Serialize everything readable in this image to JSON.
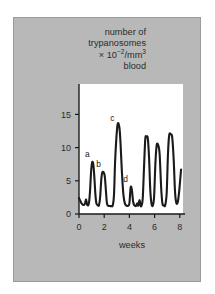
{
  "figure": {
    "background": "#ffffff",
    "panel_color": "#b8b8b8",
    "plot_background": "#ffffff",
    "line_color": "#1a1a1a"
  },
  "axis_title": {
    "line1": "number of",
    "line2": "trypanosomes",
    "line3_prefix": "× 10",
    "line3_exponent": "−2",
    "line3_suffix": "/mm",
    "line3_suffix_exponent": "3",
    "line4": "blood"
  },
  "chart_data": {
    "type": "line",
    "xlabel": "weeks",
    "ylabel": "number of trypanosomes × 10⁻²/mm³ blood",
    "xlim": [
      0,
      8.25
    ],
    "ylim": [
      0,
      17.5
    ],
    "xticks": [
      0,
      2,
      4,
      6,
      8
    ],
    "xticklabels": [
      "0",
      "2",
      "4",
      "6",
      "8"
    ],
    "yticks": [
      0,
      5,
      10,
      15
    ],
    "yticklabels": [
      "0",
      "5",
      "10",
      "15"
    ],
    "grid": false,
    "legend": null,
    "annotations": [
      {
        "label": "a",
        "x": 1.05,
        "y": 7.8,
        "note": "first major parasitaemia peak"
      },
      {
        "label": "b",
        "x": 1.95,
        "y": 6.3,
        "note": "second peak"
      },
      {
        "label": "c",
        "x": 3.05,
        "y": 13.3,
        "note": "highest peak"
      },
      {
        "label": "d",
        "x": 4.1,
        "y": 4.0,
        "note": "small peak"
      }
    ],
    "series": [
      {
        "name": "trypanosome count",
        "x": [
          0.0,
          0.1,
          0.22,
          0.34,
          0.46,
          0.56,
          0.64,
          0.72,
          0.8,
          0.88,
          0.96,
          1.05,
          1.14,
          1.22,
          1.3,
          1.38,
          1.48,
          1.58,
          1.68,
          1.76,
          1.84,
          1.95,
          2.05,
          2.14,
          2.22,
          2.32,
          2.44,
          2.56,
          2.68,
          2.78,
          2.88,
          3.05,
          3.2,
          3.3,
          3.4,
          3.52,
          3.64,
          3.78,
          3.9,
          4.0,
          4.1,
          4.2,
          4.3,
          4.42,
          4.54,
          4.62,
          4.7,
          4.8,
          4.88,
          4.96,
          5.06,
          5.16,
          5.26,
          5.36,
          5.46,
          5.56,
          5.66,
          5.76,
          5.86,
          5.96,
          6.06,
          6.16,
          6.28,
          6.4,
          6.52,
          6.62,
          6.72,
          6.84,
          6.96,
          7.06,
          7.16,
          7.28,
          7.4,
          7.52,
          7.62,
          7.72,
          7.84,
          7.96,
          8.1
        ],
        "y": [
          2.4,
          2.0,
          1.55,
          1.35,
          1.5,
          2.2,
          1.45,
          1.3,
          1.8,
          3.6,
          6.4,
          7.8,
          7.4,
          5.5,
          3.0,
          1.6,
          1.35,
          1.3,
          2.6,
          5.0,
          6.2,
          6.3,
          5.6,
          3.4,
          1.6,
          1.25,
          1.2,
          1.2,
          1.3,
          3.0,
          8.5,
          13.3,
          13.1,
          10.5,
          6.5,
          3.0,
          1.6,
          1.25,
          1.25,
          1.6,
          4.0,
          3.6,
          1.8,
          1.25,
          1.25,
          1.6,
          1.25,
          2.1,
          1.3,
          1.25,
          2.4,
          7.0,
          11.3,
          11.6,
          11.4,
          8.5,
          3.5,
          1.5,
          1.3,
          2.6,
          7.5,
          10.3,
          10.4,
          9.0,
          4.0,
          1.6,
          1.35,
          1.3,
          3.2,
          9.0,
          11.9,
          12.0,
          11.5,
          8.0,
          3.4,
          1.7,
          1.8,
          3.6,
          6.7
        ]
      }
    ]
  },
  "xaxis_title": "weeks"
}
